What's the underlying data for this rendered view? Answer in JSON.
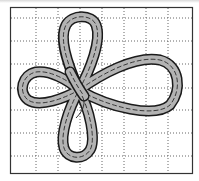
{
  "figure": {
    "colors": {
      "background": "#ffffff",
      "frame": "#333333",
      "grid": "#555555",
      "band_fill": "#b3b3b3",
      "band_outline": "#1a1a1a",
      "stitch": "#2a2a2a"
    },
    "frame": {
      "x": 10,
      "y": 7,
      "width": 183,
      "height": 167
    },
    "grid": {
      "vertical_x": [
        36,
        58,
        80,
        102,
        124,
        146,
        168
      ],
      "horizontal_y": [
        18,
        41,
        64,
        88,
        110,
        133,
        156
      ]
    },
    "loops": [
      {
        "name": "top-loop"
      },
      {
        "name": "right-loop"
      },
      {
        "name": "bottom-loop"
      },
      {
        "name": "left-loop"
      }
    ],
    "center": {
      "x": 79,
      "y": 90
    }
  }
}
